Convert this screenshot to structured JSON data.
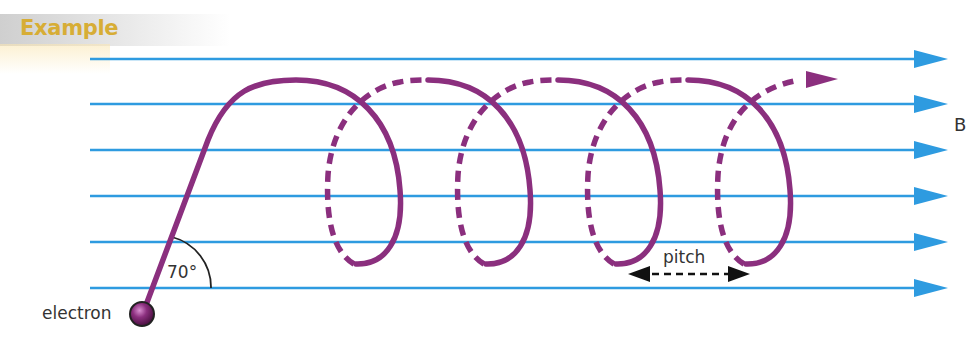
{
  "header": {
    "title": "Example"
  },
  "labels": {
    "particle": "electron",
    "angle": "70°",
    "pitch": "pitch",
    "field": "B"
  },
  "colors": {
    "field_lines": "#2e9be0",
    "helix": "#8b2f7e",
    "banner_text": "#d7ad35",
    "label_text": "#333333"
  },
  "diagram": {
    "field_line_count": 6,
    "field_direction": "right",
    "helix_turns": 4,
    "entry_angle_deg": 70
  }
}
